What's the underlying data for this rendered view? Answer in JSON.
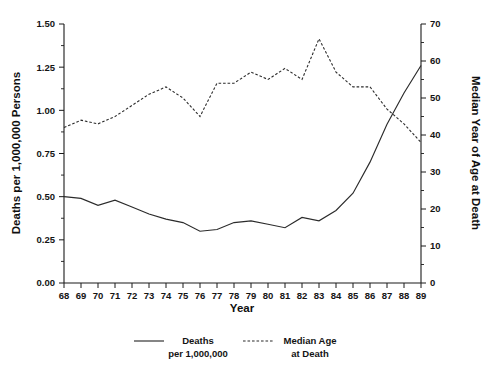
{
  "chart_data": {
    "type": "line",
    "title": "",
    "xlabel": "Year",
    "ylabel": "Deaths per 1,000,000 Persons",
    "ylabel_right": "Median Year of Age at Death",
    "grid": false,
    "legend_position": "bottom",
    "x": [
      68,
      69,
      70,
      71,
      72,
      73,
      74,
      75,
      76,
      77,
      78,
      79,
      80,
      81,
      82,
      83,
      84,
      85,
      86,
      87,
      88,
      89
    ],
    "xtick_labels": [
      "68",
      "69",
      "70",
      "71",
      "72",
      "73",
      "74",
      "75",
      "76",
      "77",
      "78",
      "79",
      "80",
      "81",
      "82",
      "83",
      "84",
      "85",
      "86",
      "87",
      "88",
      "89"
    ],
    "xlim": [
      68,
      89
    ],
    "ylim_left": [
      0.0,
      1.5
    ],
    "ytick_labels_left": [
      "0.00",
      "0.25",
      "0.50",
      "0.75",
      "1.00",
      "1.25",
      "1.50"
    ],
    "ytick_values_left": [
      0.0,
      0.25,
      0.5,
      0.75,
      1.0,
      1.25,
      1.5
    ],
    "ylim_right": [
      0,
      70
    ],
    "ytick_labels_right": [
      "0",
      "10",
      "20",
      "30",
      "40",
      "50",
      "60",
      "70"
    ],
    "ytick_values_right": [
      0,
      10,
      20,
      30,
      40,
      50,
      60,
      70
    ],
    "series": [
      {
        "name": "Deaths per 1,000,000",
        "axis": "left",
        "style": "solid",
        "values": [
          0.5,
          0.49,
          0.45,
          0.48,
          0.44,
          0.4,
          0.37,
          0.35,
          0.3,
          0.31,
          0.35,
          0.36,
          0.34,
          0.32,
          0.38,
          0.36,
          0.42,
          0.52,
          0.7,
          0.92,
          1.1,
          1.26
        ]
      },
      {
        "name": "Median Age at Death",
        "axis": "right",
        "style": "dotted",
        "values": [
          42,
          44,
          43,
          45,
          48,
          51,
          53,
          50,
          45,
          54,
          54,
          57,
          55,
          58,
          55,
          66,
          57,
          53,
          53,
          47,
          43,
          38
        ]
      }
    ],
    "legend": [
      {
        "label_line1": "Deaths",
        "label_line2": "per 1,000,000",
        "style": "solid"
      },
      {
        "label_line1": "Median Age",
        "label_line2": "at Death",
        "style": "dotted"
      }
    ]
  }
}
